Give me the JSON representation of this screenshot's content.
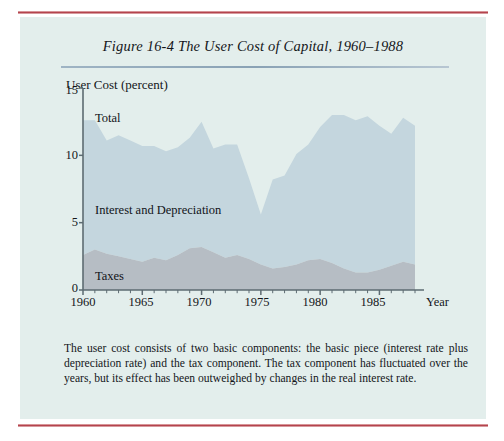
{
  "figure": {
    "title": "Figure 16-4   The User Cost of Capital, 1960–1988",
    "caption": "The user cost consists of two basic components: the basic piece (interest rate plus depreciation rate) and the tax component. The tax component has fluctuated over the years, but its effect has been outweighed by changes in the real interest rate."
  },
  "axes": {
    "ylabel": "User Cost (percent)",
    "xlabel": "Year",
    "yticks": [
      "15",
      "10",
      "5",
      "0"
    ],
    "xticks": [
      "1960",
      "1965",
      "1970",
      "1975",
      "1980",
      "1985"
    ]
  },
  "labels": {
    "total": "Total",
    "interest": "Interest and Depreciation",
    "taxes": "Taxes"
  },
  "colors": {
    "page_panel": "#e3eeec",
    "rule": "#b03a44",
    "interest_band": "#c4d6de",
    "taxes_band": "#b6bdc4",
    "axis": "#5d6b72",
    "text": "#14161a"
  },
  "chart_data": {
    "type": "area",
    "title": "The User Cost of Capital, 1960–1988",
    "xlabel": "Year",
    "ylabel": "User Cost (percent)",
    "xlim": [
      1960,
      1988
    ],
    "ylim": [
      0,
      15
    ],
    "grid": false,
    "legend": "inline-labels",
    "stacked": true,
    "x": [
      1960,
      1961,
      1962,
      1963,
      1964,
      1965,
      1966,
      1967,
      1968,
      1969,
      1970,
      1971,
      1972,
      1973,
      1974,
      1975,
      1976,
      1977,
      1978,
      1979,
      1980,
      1981,
      1982,
      1983,
      1984,
      1985,
      1986,
      1987,
      1988
    ],
    "series": [
      {
        "name": "Taxes",
        "values": [
          2.6,
          3.0,
          2.7,
          2.5,
          2.3,
          2.1,
          2.4,
          2.2,
          2.6,
          3.1,
          3.2,
          2.8,
          2.4,
          2.6,
          2.3,
          1.9,
          1.6,
          1.7,
          1.9,
          2.2,
          2.3,
          2.0,
          1.6,
          1.3,
          1.3,
          1.5,
          1.8,
          2.1,
          1.9
        ]
      },
      {
        "name": "Interest and Depreciation",
        "values": [
          10.0,
          9.6,
          8.4,
          9.0,
          8.8,
          8.6,
          8.3,
          8.1,
          8.0,
          8.2,
          9.3,
          7.7,
          8.4,
          8.2,
          6.0,
          3.7,
          6.6,
          6.8,
          8.2,
          8.6,
          9.8,
          11.0,
          11.4,
          11.3,
          11.6,
          10.7,
          9.8,
          10.7,
          10.3
        ]
      }
    ],
    "total": [
      12.6,
      12.6,
      11.1,
      11.5,
      11.1,
      10.7,
      10.7,
      10.3,
      10.6,
      11.3,
      12.5,
      10.5,
      10.8,
      10.8,
      8.3,
      5.6,
      8.2,
      8.5,
      10.1,
      10.8,
      12.1,
      13.0,
      13.0,
      12.6,
      12.9,
      12.2,
      11.6,
      12.8,
      12.2
    ]
  }
}
